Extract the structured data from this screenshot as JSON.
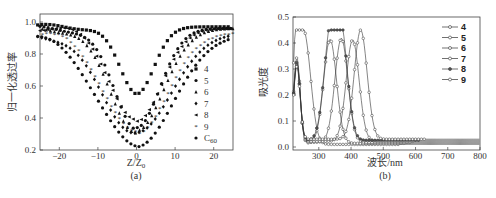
{
  "chart_data": [
    {
      "type": "scatter",
      "panel_label": "(a)",
      "title": "",
      "xlabel": "Z/Z0",
      "ylabel": "归一化透过率",
      "xlim": [
        -25,
        25
      ],
      "ylim": [
        0.2,
        1.05
      ],
      "xticks": [
        "-20",
        "-10",
        "0",
        "10",
        "20"
      ],
      "yticks": [
        "0.2",
        "0.4",
        "0.6",
        "0.8",
        "1.0"
      ],
      "grid": false,
      "legend_position": "right-inside",
      "series": [
        {
          "name": "4",
          "marker": "square",
          "min_T": 0.55,
          "width": 4.5,
          "baseline": 0.97
        },
        {
          "name": "5",
          "marker": "circle",
          "min_T": 0.34,
          "width": 6,
          "baseline": 0.96
        },
        {
          "name": "6",
          "marker": "triangle-up",
          "min_T": 0.32,
          "width": 7,
          "baseline": 0.96
        },
        {
          "name": "7",
          "marker": "diamond",
          "min_T": 0.31,
          "width": 9,
          "baseline": 0.93
        },
        {
          "name": "8",
          "marker": "triangle-left",
          "min_T": 0.38,
          "width": 6.5,
          "baseline": 0.96
        },
        {
          "name": "9",
          "marker": "star",
          "min_T": 0.3,
          "width": 8,
          "baseline": 0.93
        },
        {
          "name": "C60",
          "marker": "hexagon",
          "min_T": 0.22,
          "width": 9.5,
          "baseline": 0.92
        }
      ]
    },
    {
      "type": "line",
      "panel_label": "(b)",
      "title": "",
      "xlabel": "波长/nm",
      "ylabel": "吸光度",
      "xlim": [
        220,
        800
      ],
      "ylim": [
        -0.01,
        0.5
      ],
      "xticks": [
        "300",
        "400",
        "500",
        "600",
        "700",
        "800"
      ],
      "yticks": [
        "0.0",
        "0.1",
        "0.2",
        "0.3",
        "0.4",
        "0.5"
      ],
      "grid": false,
      "legend_position": "upper-right",
      "series": [
        {
          "name": "4",
          "peaks": [
            [
              255,
              0.42
            ],
            [
              232,
              0.34
            ]
          ],
          "x_peak_nm": 260,
          "y_peak": 0.43
        },
        {
          "name": "5",
          "peaks": [
            [
              335,
              0.4
            ],
            [
              232,
              0.33
            ]
          ],
          "x_peak_nm": 335,
          "y_peak": 0.4
        },
        {
          "name": "6",
          "peaks": [
            [
              370,
              0.4
            ],
            [
              232,
              0.31
            ]
          ],
          "x_peak_nm": 370,
          "y_peak": 0.4
        },
        {
          "name": "7",
          "peaks": [
            [
              405,
              0.39
            ],
            [
              232,
              0.3
            ]
          ],
          "x_peak_nm": 405,
          "y_peak": 0.39
        },
        {
          "name": "8",
          "peaks": [
            [
              335,
              0.38
            ],
            [
              370,
              0.39
            ],
            [
              232,
              0.3
            ]
          ],
          "x_peak_nm": 370,
          "y_peak": 0.39
        },
        {
          "name": "9",
          "peaks": [
            [
              430,
              0.42
            ],
            [
              232,
              0.28
            ]
          ],
          "x_peak_nm": 430,
          "y_peak": 0.42
        }
      ]
    }
  ],
  "panel_a": {
    "ylabel": "归一化透过率",
    "xlabel_main": "Z/Z",
    "xlabel_sub": "0",
    "caption": "(a)",
    "xticks": [
      "−20",
      "−10",
      "0",
      "10",
      "20"
    ],
    "yticks": [
      "0.2",
      "0.4",
      "0.6",
      "0.8",
      "1.0"
    ],
    "legend": [
      "4",
      "5",
      "6",
      "7",
      "8",
      "9",
      "C"
    ],
    "legend_c60_sub": "60"
  },
  "panel_b": {
    "ylabel": "吸光度",
    "xlabel": "波长/nm",
    "caption": "(b)",
    "xticks": [
      "300",
      "400",
      "500",
      "600",
      "700",
      "800"
    ],
    "yticks": [
      "0.0",
      "0.1",
      "0.2",
      "0.3",
      "0.4",
      "0.5"
    ],
    "legend": [
      "4",
      "5",
      "6",
      "7",
      "8",
      "9"
    ]
  }
}
